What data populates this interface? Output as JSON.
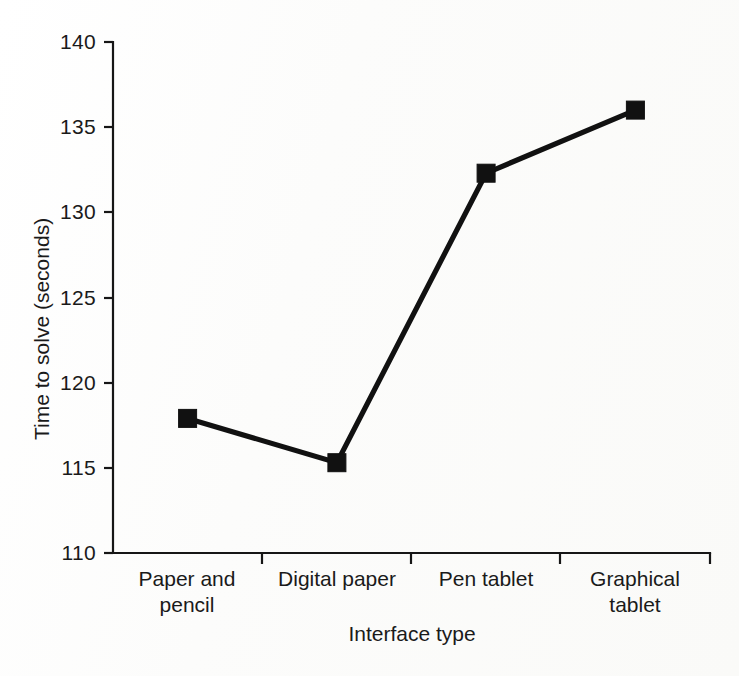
{
  "chart_data": {
    "type": "line",
    "title": "",
    "xlabel": "Interface type",
    "ylabel": "Time to solve (seconds)",
    "categories": [
      "Paper and pencil",
      "Digital paper",
      "Pen tablet",
      "Graphical tablet"
    ],
    "category_lines": [
      [
        "Paper and",
        "pencil"
      ],
      [
        "Digital paper",
        ""
      ],
      [
        "Pen tablet",
        ""
      ],
      [
        "Graphical",
        "tablet"
      ]
    ],
    "values": [
      117.9,
      115.3,
      132.3,
      136.0
    ],
    "ylim": [
      110,
      140
    ],
    "yticks": [
      110,
      115,
      120,
      125,
      130,
      135,
      140
    ],
    "ytick_labels": [
      "110",
      "115",
      "120",
      "125",
      "130",
      "135",
      "140"
    ],
    "grid": false,
    "legend": null,
    "series": [
      {
        "name": "Time to solve",
        "values": [
          117.9,
          115.3,
          132.3,
          136.0
        ],
        "color": "#111111",
        "marker": "square",
        "line_width": 5.2
      }
    ],
    "colors": {
      "line": "#111111",
      "marker": "#111111",
      "axis": "#161616",
      "background": "#fdfdfd",
      "text": "#1a1a1a"
    }
  }
}
